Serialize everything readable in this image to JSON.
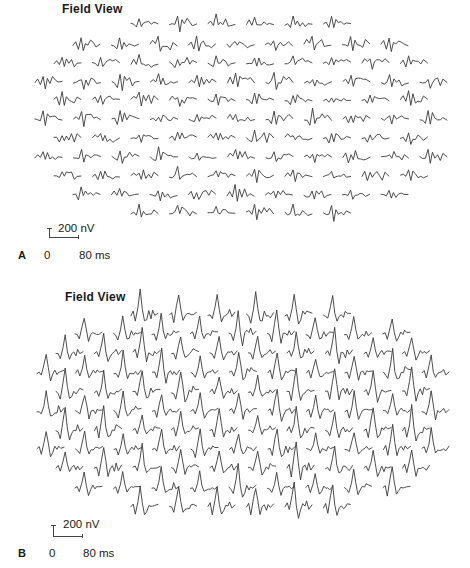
{
  "figure": {
    "panels": [
      {
        "id": "A",
        "letter": "A",
        "title": "Field View",
        "scale": {
          "amplitude_label": "200 nV",
          "time_zero": "0",
          "time_end": "80 ms"
        },
        "waveform": "flat-noisy",
        "trace_width": 27,
        "amplitude_px": 6,
        "rows": [
          {
            "count": 6,
            "x0": 131,
            "y": 24
          },
          {
            "count": 9,
            "x0": 73,
            "y": 45
          },
          {
            "count": 10,
            "x0": 54,
            "y": 63
          },
          {
            "count": 11,
            "x0": 35,
            "y": 82
          },
          {
            "count": 10,
            "x0": 54,
            "y": 100
          },
          {
            "count": 11,
            "x0": 35,
            "y": 119
          },
          {
            "count": 10,
            "x0": 54,
            "y": 138
          },
          {
            "count": 11,
            "x0": 35,
            "y": 157
          },
          {
            "count": 10,
            "x0": 54,
            "y": 176
          },
          {
            "count": 9,
            "x0": 73,
            "y": 195
          },
          {
            "count": 6,
            "x0": 131,
            "y": 213
          }
        ],
        "col_spacing": 38.5
      },
      {
        "id": "B",
        "letter": "B",
        "title": "Field View",
        "scale": {
          "amplitude_label": "200 nV",
          "time_zero": "0",
          "time_end": "80 ms"
        },
        "waveform": "mferg-peak",
        "trace_width": 27,
        "amplitude_px": 20,
        "rows": [
          {
            "count": 6,
            "x0": 131,
            "y": 31
          },
          {
            "count": 9,
            "x0": 75,
            "y": 50
          },
          {
            "count": 10,
            "x0": 56,
            "y": 69
          },
          {
            "count": 11,
            "x0": 37,
            "y": 89
          },
          {
            "count": 10,
            "x0": 56,
            "y": 108
          },
          {
            "count": 11,
            "x0": 37,
            "y": 127
          },
          {
            "count": 10,
            "x0": 56,
            "y": 146
          },
          {
            "count": 11,
            "x0": 37,
            "y": 165
          },
          {
            "count": 10,
            "x0": 56,
            "y": 184
          },
          {
            "count": 9,
            "x0": 75,
            "y": 204
          },
          {
            "count": 6,
            "x0": 131,
            "y": 223
          }
        ],
        "col_spacing": 38.5
      }
    ],
    "waveform_templates": {
      "flat-noisy": [
        [
          0,
          0
        ],
        [
          0.1,
          0.2
        ],
        [
          0.2,
          -0.3
        ],
        [
          0.3,
          0.9
        ],
        [
          0.38,
          -0.6
        ],
        [
          0.46,
          0.4
        ],
        [
          0.55,
          0.1
        ],
        [
          0.65,
          0.3
        ],
        [
          0.75,
          -0.1
        ],
        [
          0.85,
          0.2
        ],
        [
          1,
          0
        ]
      ],
      "mferg-peak": [
        [
          0,
          0
        ],
        [
          0.08,
          0.05
        ],
        [
          0.16,
          -0.25
        ],
        [
          0.26,
          0.35
        ],
        [
          0.34,
          1.0
        ],
        [
          0.42,
          0.2
        ],
        [
          0.5,
          -0.35
        ],
        [
          0.58,
          -0.1
        ],
        [
          0.66,
          0.05
        ],
        [
          0.74,
          -0.05
        ],
        [
          0.8,
          0.12
        ],
        [
          0.88,
          0.02
        ],
        [
          1,
          0.1
        ]
      ]
    }
  }
}
